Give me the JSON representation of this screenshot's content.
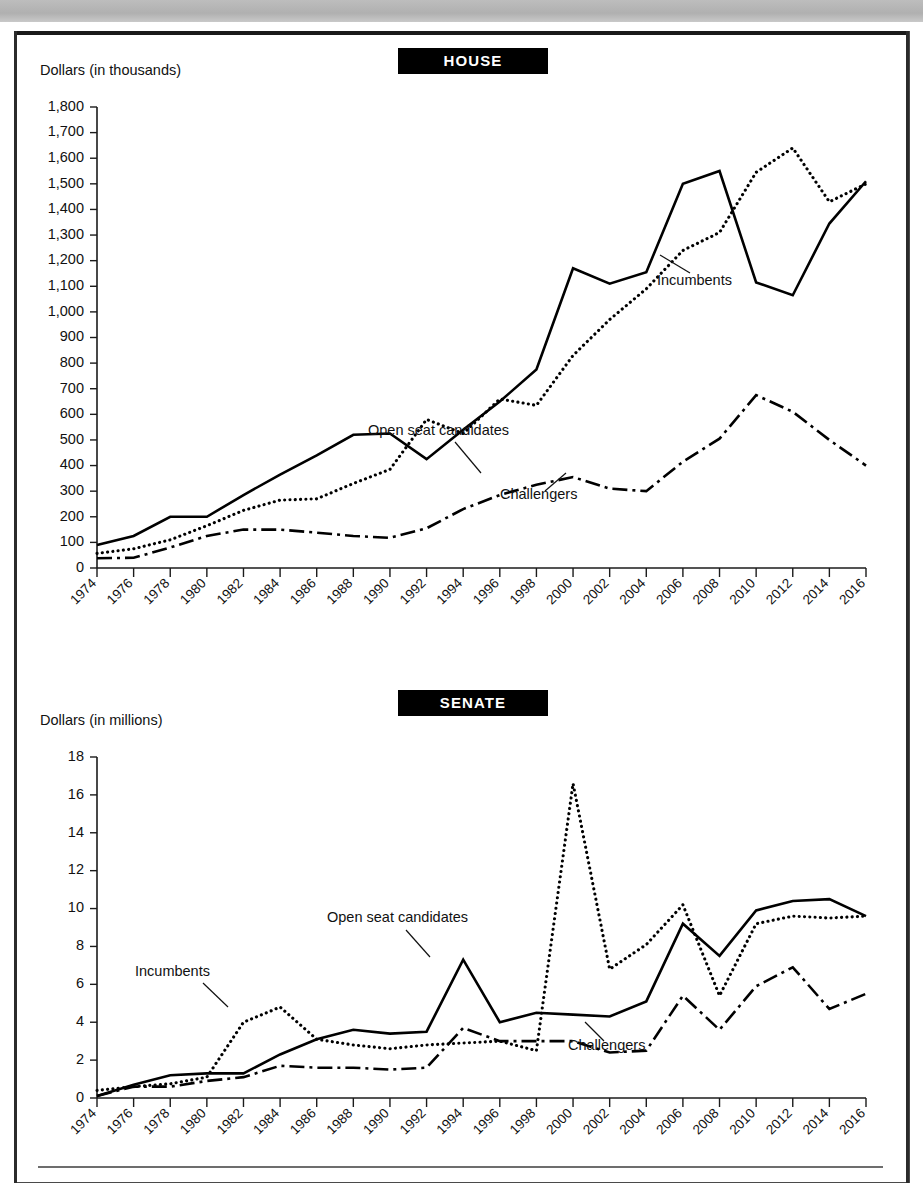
{
  "page": {
    "house_badge": "HOUSE",
    "senate_badge": "SENATE",
    "house_axis_title": "Dollars (in thousands)",
    "senate_axis_title": "Dollars (in millions)"
  },
  "annotations": {
    "incumbents": "Incumbents",
    "open_seat": "Open seat candidates",
    "challengers": "Challengers"
  },
  "chart_data": [
    {
      "type": "line",
      "title": "HOUSE",
      "ylabel": "Dollars (in thousands)",
      "xlabel": "",
      "ylim": [
        0,
        1800
      ],
      "ytick_labels": [
        "0",
        "100",
        "200",
        "300",
        "400",
        "500",
        "600",
        "700",
        "800",
        "900",
        "1,000",
        "1,100",
        "1,200",
        "1,300",
        "1,400",
        "1,500",
        "1,600",
        "1,700",
        "1,800"
      ],
      "yticks": [
        0,
        100,
        200,
        300,
        400,
        500,
        600,
        700,
        800,
        900,
        1000,
        1100,
        1200,
        1300,
        1400,
        1500,
        1600,
        1700,
        1800
      ],
      "grid": false,
      "legend_position": "inline-annotations",
      "categories": [
        "1974",
        "1976",
        "1978",
        "1980",
        "1982",
        "1984",
        "1986",
        "1988",
        "1990",
        "1992",
        "1994",
        "1996",
        "1998",
        "2000",
        "2002",
        "2004",
        "2006",
        "2008",
        "2010",
        "2012",
        "2014",
        "2016"
      ],
      "series": [
        {
          "name": "Open seat candidates",
          "style": "solid",
          "values": [
            90,
            125,
            200,
            200,
            285,
            365,
            440,
            520,
            525,
            425,
            540,
            650,
            775,
            1170,
            1110,
            1155,
            1500,
            1550,
            1115,
            1065,
            1345,
            1510
          ]
        },
        {
          "name": "Incumbents",
          "style": "dotted",
          "values": [
            57,
            75,
            110,
            165,
            225,
            265,
            270,
            330,
            385,
            580,
            525,
            660,
            635,
            830,
            970,
            1090,
            1240,
            1310,
            1545,
            1640,
            1430,
            1500
          ]
        },
        {
          "name": "Challengers",
          "style": "dash-dot",
          "values": [
            38,
            40,
            80,
            125,
            150,
            150,
            138,
            125,
            118,
            155,
            230,
            285,
            325,
            355,
            310,
            300,
            415,
            505,
            675,
            610,
            500,
            400
          ]
        }
      ]
    },
    {
      "type": "line",
      "title": "SENATE",
      "ylabel": "Dollars (in millions)",
      "xlabel": "",
      "ylim": [
        0,
        18
      ],
      "ytick_labels": [
        "0",
        "2",
        "4",
        "6",
        "8",
        "10",
        "12",
        "14",
        "16",
        "18"
      ],
      "yticks": [
        0,
        2,
        4,
        6,
        8,
        10,
        12,
        14,
        16,
        18
      ],
      "grid": false,
      "legend_position": "inline-annotations",
      "categories": [
        "1974",
        "1976",
        "1978",
        "1980",
        "1982",
        "1984",
        "1986",
        "1988",
        "1990",
        "1992",
        "1994",
        "1996",
        "1998",
        "2000",
        "2002",
        "2004",
        "2006",
        "2008",
        "2010",
        "2012",
        "2014",
        "2016"
      ],
      "series": [
        {
          "name": "Open seat candidates",
          "style": "solid",
          "values": [
            0.1,
            0.7,
            1.2,
            1.3,
            1.3,
            2.3,
            3.1,
            3.6,
            3.4,
            3.5,
            7.3,
            4.0,
            4.5,
            4.4,
            4.3,
            5.1,
            9.2,
            7.5,
            9.9,
            10.4,
            10.5,
            9.6
          ]
        },
        {
          "name": "Incumbents",
          "style": "dotted",
          "values": [
            0.4,
            0.6,
            0.75,
            1.1,
            4.0,
            4.8,
            3.1,
            2.8,
            2.6,
            2.8,
            2.9,
            3.0,
            2.5,
            16.6,
            6.8,
            8.1,
            10.2,
            5.4,
            9.2,
            9.6,
            9.5,
            9.6
          ]
        },
        {
          "name": "Challengers",
          "style": "dash-dot",
          "values": [
            0.1,
            0.6,
            0.6,
            0.9,
            1.1,
            1.7,
            1.6,
            1.6,
            1.5,
            1.6,
            3.7,
            3.0,
            3.0,
            3.0,
            2.4,
            2.5,
            5.4,
            3.6,
            5.9,
            6.9,
            4.7,
            5.5
          ]
        }
      ]
    }
  ]
}
